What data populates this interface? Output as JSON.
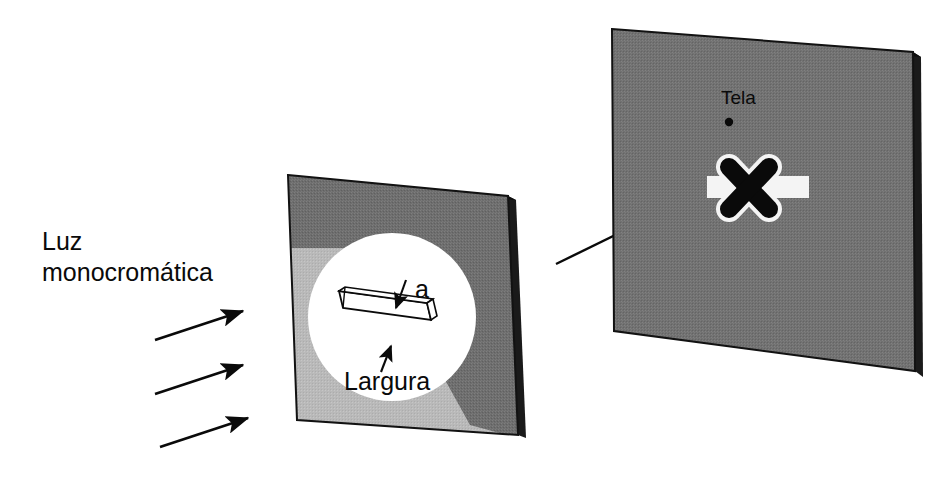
{
  "figure": {
    "kind": "optics-diagram",
    "background_color": "#ffffff"
  },
  "labels": {
    "source_line1": "Luz",
    "source_line2": "monocromática",
    "slit_width_symbol": "a",
    "slit_width_word": "Largura",
    "screen_name": "Tela"
  },
  "colors": {
    "panel_face": "#6e6e6e",
    "panel_face_screen": "#727272",
    "panel_edge": "#141414",
    "panel_side": "#2b2b2b",
    "light_spill": "#b9b9b9",
    "aperture_circle": "#ffffff",
    "fringe_band": "#f2f2f2",
    "marker_x": "#0a0a0a",
    "ink": "#0a0a0a"
  },
  "elements": {
    "incoming_rays": {
      "name": "incoming-light-arrows",
      "count": 3,
      "arrows": [
        {
          "x1": 155,
          "y1": 340,
          "x2": 247,
          "y2": 310
        },
        {
          "x1": 155,
          "y1": 394,
          "x2": 247,
          "y2": 364
        },
        {
          "x1": 160,
          "y1": 447,
          "x2": 252,
          "y2": 417
        }
      ]
    },
    "slit_panel": {
      "name": "slit-panel",
      "corners": "288,175 508,196 518,435 297,420",
      "aperture_center_x": 392,
      "aperture_center_y": 317,
      "aperture_radius": 84
    },
    "slit_bar": {
      "name": "slit-aperture-bar",
      "top_arrow": {
        "x1": 404,
        "y1": 285,
        "x2": 395,
        "y2": 312
      },
      "bottom_arrow": {
        "x1": 383,
        "y1": 370,
        "x2": 390,
        "y2": 344
      }
    },
    "pointer_arrow": {
      "name": "screen-pointer-arrow",
      "x1": 556,
      "y1": 263,
      "x2": 652,
      "y2": 216
    },
    "screen_panel": {
      "name": "screen-panel",
      "corners": "612,29 913,52 915,371 614,331"
    },
    "diffraction_pattern": {
      "name": "diffraction-fringe-band",
      "band_x": 707,
      "band_y": 176,
      "band_width": 102,
      "band_height": 22,
      "marker": "X"
    },
    "screen_dot": {
      "name": "screen-center-dot",
      "cx": 729,
      "cy": 122,
      "r": 4
    }
  }
}
